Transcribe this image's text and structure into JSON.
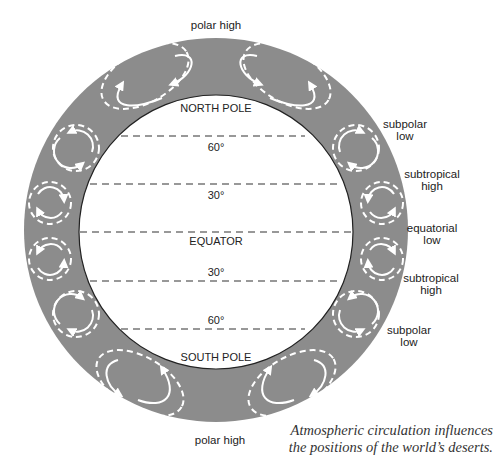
{
  "diagram": {
    "colors": {
      "ring": "#8c8c8c",
      "inner": "#ffffff",
      "cell_stroke": "#ffffff",
      "latitude_line": "#333333",
      "text": "#222222"
    },
    "pressure_labels": {
      "polar_high_top": "polar high",
      "polar_high_bottom": "polar high",
      "subpolar_low_north": [
        "subpolar",
        "low"
      ],
      "subtropical_high_north": [
        "subtropical",
        "high"
      ],
      "equatorial_low": [
        "equatorial",
        "low"
      ],
      "subtropical_high_south": [
        "subtropical",
        "high"
      ],
      "subpolar_low_south": [
        "subpolar",
        "low"
      ]
    },
    "latitude_labels": {
      "north_pole": "NORTH POLE",
      "lat60n": "60°",
      "lat30n": "30°",
      "equator": "EQUATOR",
      "lat30s": "30°",
      "lat60s": "60°",
      "south_pole": "SOUTH POLE"
    },
    "cells": [
      {
        "name": "polar-cell-north-west"
      },
      {
        "name": "polar-cell-north-east"
      },
      {
        "name": "ferrel-cell-north-west"
      },
      {
        "name": "ferrel-cell-north-east"
      },
      {
        "name": "hadley-cell-north-west"
      },
      {
        "name": "hadley-cell-north-east"
      },
      {
        "name": "hadley-cell-south-west"
      },
      {
        "name": "hadley-cell-south-east"
      },
      {
        "name": "ferrel-cell-south-west"
      },
      {
        "name": "ferrel-cell-south-east"
      },
      {
        "name": "polar-cell-south-west"
      },
      {
        "name": "polar-cell-south-east"
      }
    ]
  },
  "caption": {
    "line1": "Atmospheric circulation influences",
    "line2": "the positions of the world’s deserts."
  }
}
